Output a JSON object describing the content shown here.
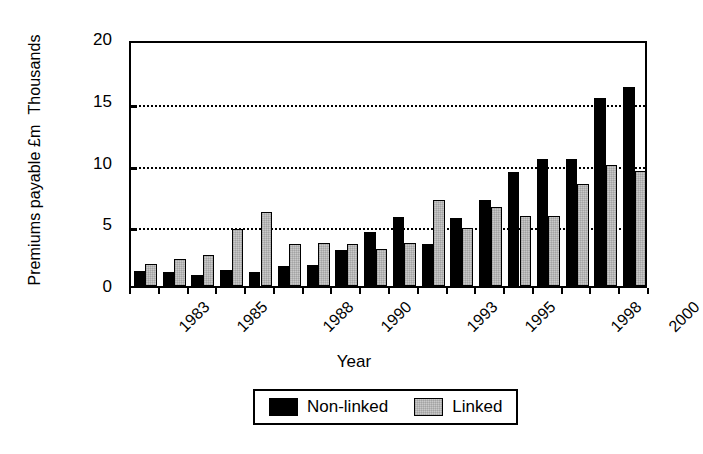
{
  "chart_data": {
    "type": "bar",
    "title": "",
    "xlabel": "Year",
    "ylabel": "Premiums payable £m Thousands",
    "ylabel_lines": [
      "Premiums payable £m",
      "Thousands"
    ],
    "ylim": [
      0,
      20
    ],
    "yticks": [
      0,
      5,
      10,
      15,
      20
    ],
    "ytick_labels": [
      "0",
      "5",
      "10",
      "15",
      "20"
    ],
    "grid": "horizontal-dotted",
    "legend_position": "bottom-center",
    "categories": [
      "1983",
      "1984",
      "1985",
      "1986",
      "1987",
      "1988",
      "1989",
      "1990",
      "1991",
      "1992",
      "1993",
      "1994",
      "1995",
      "1996",
      "1997",
      "1998",
      "1999",
      "2000"
    ],
    "xtick_labels_shown": [
      "1983",
      "",
      "1985",
      "",
      "",
      "1988",
      "",
      "1990",
      "",
      "",
      "1993",
      "",
      "1995",
      "",
      "",
      "1998",
      "",
      "2000"
    ],
    "series": [
      {
        "name": "Non-linked",
        "color": "#000000",
        "values": [
          1.2,
          1.1,
          0.9,
          1.3,
          1.1,
          1.6,
          1.7,
          2.9,
          4.4,
          5.6,
          3.4,
          5.5,
          7.0,
          9.2,
          10.3,
          10.3,
          15.2,
          16.1
        ]
      },
      {
        "name": "Linked",
        "color": "#c9c9c9",
        "values": [
          1.8,
          2.2,
          2.5,
          4.6,
          6.0,
          3.4,
          3.5,
          3.4,
          3.0,
          3.5,
          7.0,
          4.7,
          6.4,
          5.7,
          5.7,
          8.3,
          9.8,
          9.3
        ]
      }
    ]
  },
  "axis": {
    "y_title_line1": "Premiums payable £m",
    "y_title_line2": "Thousands",
    "x_title": "Year"
  },
  "legend": {
    "items": [
      {
        "label": "Non-linked",
        "swatch": "black"
      },
      {
        "label": "Linked",
        "swatch": "grey"
      }
    ]
  }
}
